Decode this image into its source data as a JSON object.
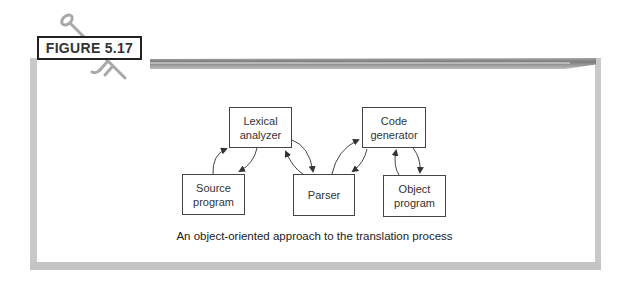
{
  "figure": {
    "label": "FIGURE 5.17",
    "caption": "An object-oriented approach to the translation process"
  },
  "diagram": {
    "nodes": [
      {
        "id": "lexical",
        "line1": "Lexical",
        "line2": "analyzer"
      },
      {
        "id": "codegen",
        "line1": "Code",
        "line2": "generator"
      },
      {
        "id": "source",
        "line1": "Source",
        "line2": "program"
      },
      {
        "id": "parser",
        "line1": "Parser",
        "line2": ""
      },
      {
        "id": "object",
        "line1": "Object",
        "line2": "program"
      }
    ],
    "edges": [
      {
        "from": "source",
        "to": "lexical"
      },
      {
        "from": "lexical",
        "to": "source"
      },
      {
        "from": "lexical",
        "to": "parser"
      },
      {
        "from": "parser",
        "to": "lexical"
      },
      {
        "from": "parser",
        "to": "codegen"
      },
      {
        "from": "codegen",
        "to": "parser"
      },
      {
        "from": "codegen",
        "to": "object"
      },
      {
        "from": "object",
        "to": "codegen"
      }
    ]
  },
  "colors": {
    "frame": "#c9c9c9",
    "border": "#444444",
    "text": "#333333"
  }
}
